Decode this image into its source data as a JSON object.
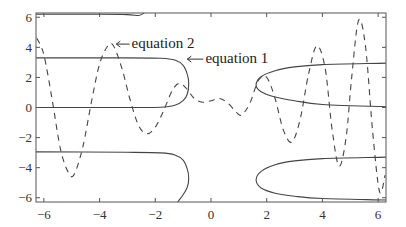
{
  "chart_data": {
    "type": "line",
    "title": "",
    "xlabel": "",
    "ylabel": "",
    "xlim": [
      -6.2832,
      6.2832
    ],
    "ylim": [
      -6.2832,
      6.2832
    ],
    "grid": false,
    "legend": null,
    "xticks": [
      -6,
      -4,
      -2,
      0,
      2,
      4,
      6
    ],
    "yticks": [
      -6,
      -4,
      -2,
      0,
      2,
      4,
      6
    ],
    "xtick_labels": [
      "−6",
      "−4",
      "−2",
      "0",
      "2",
      "4",
      "6"
    ],
    "ytick_labels": [
      "−6",
      "−4",
      "−2",
      "0",
      "2",
      "4",
      "6"
    ],
    "annotations": [
      {
        "text": "equation 2",
        "arrow_to": [
          -3.4,
          4.2
        ],
        "text_at": [
          -2.85,
          3.95
        ]
      },
      {
        "text": "equation 1",
        "arrow_to": [
          -0.85,
          3.2
        ],
        "text_at": [
          -0.2,
          2.95
        ]
      }
    ],
    "series": [
      {
        "name": "equation 1",
        "style": "solid",
        "segments": [
          [
            [
              -6.28,
              6.2
            ],
            [
              -4,
              6.2
            ],
            [
              -3,
              6.18
            ],
            [
              -2.6,
              6.12
            ],
            [
              -2.4,
              6.28
            ]
          ],
          [
            [
              -6.28,
              3.3
            ],
            [
              -3,
              3.3
            ],
            [
              -1.8,
              3.27
            ],
            [
              -1.3,
              3.15
            ],
            [
              -1.0,
              2.8
            ],
            [
              -0.85,
              2.2
            ],
            [
              -0.8,
              1.6
            ],
            [
              -0.85,
              0.9
            ],
            [
              -1.0,
              0.45
            ],
            [
              -1.3,
              0.15
            ],
            [
              -1.8,
              0.02
            ],
            [
              -3,
              0.0
            ],
            [
              -6.28,
              0.0
            ]
          ],
          [
            [
              -6.28,
              -2.95
            ],
            [
              -3,
              -2.98
            ],
            [
              -1.8,
              -3.02
            ],
            [
              -1.3,
              -3.15
            ],
            [
              -1.0,
              -3.5
            ],
            [
              -0.85,
              -4.1
            ],
            [
              -0.8,
              -4.7
            ],
            [
              -0.85,
              -5.3
            ],
            [
              -1.0,
              -5.8
            ],
            [
              -1.2,
              -6.28
            ]
          ],
          [
            [
              6.28,
              2.95
            ],
            [
              4,
              2.85
            ],
            [
              3,
              2.7
            ],
            [
              2.3,
              2.45
            ],
            [
              1.8,
              2.05
            ],
            [
              1.62,
              1.5
            ],
            [
              1.8,
              1.05
            ],
            [
              2.3,
              0.7
            ],
            [
              3,
              0.45
            ],
            [
              4,
              0.2
            ],
            [
              6.28,
              0.05
            ]
          ],
          [
            [
              6.28,
              -3.3
            ],
            [
              4,
              -3.4
            ],
            [
              3,
              -3.55
            ],
            [
              2.3,
              -3.8
            ],
            [
              1.8,
              -4.25
            ],
            [
              1.62,
              -4.8
            ],
            [
              1.8,
              -5.35
            ],
            [
              2.3,
              -5.7
            ],
            [
              3,
              -5.9
            ],
            [
              4,
              -6.05
            ],
            [
              6.28,
              -6.15
            ]
          ]
        ]
      },
      {
        "name": "equation 2",
        "style": "dashed",
        "points": [
          [
            -6.25,
            4.6
          ],
          [
            -6.0,
            3.5
          ],
          [
            -5.7,
            0.5
          ],
          [
            -5.4,
            -2.8
          ],
          [
            -5.1,
            -4.4
          ],
          [
            -4.9,
            -4.4
          ],
          [
            -4.6,
            -2.6
          ],
          [
            -4.3,
            0.3
          ],
          [
            -4.0,
            2.9
          ],
          [
            -3.7,
            4.1
          ],
          [
            -3.5,
            4.1
          ],
          [
            -3.2,
            2.6
          ],
          [
            -2.9,
            0.5
          ],
          [
            -2.6,
            -1.2
          ],
          [
            -2.3,
            -1.75
          ],
          [
            -2.0,
            -1.3
          ],
          [
            -1.7,
            -0.2
          ],
          [
            -1.4,
            1.1
          ],
          [
            -1.15,
            1.6
          ],
          [
            -0.9,
            1.3
          ],
          [
            -0.6,
            0.6
          ],
          [
            -0.3,
            0.35
          ],
          [
            0.0,
            0.45
          ],
          [
            0.3,
            0.6
          ],
          [
            0.6,
            0.3
          ],
          [
            0.9,
            -0.3
          ],
          [
            1.1,
            -0.5
          ],
          [
            1.4,
            0.3
          ],
          [
            1.7,
            1.8
          ],
          [
            2.0,
            2.0
          ],
          [
            2.3,
            0.6
          ],
          [
            2.6,
            -1.5
          ],
          [
            2.9,
            -2.3
          ],
          [
            3.2,
            -0.8
          ],
          [
            3.5,
            2.2
          ],
          [
            3.8,
            4.1
          ],
          [
            4.1,
            2.6
          ],
          [
            4.35,
            -1.5
          ],
          [
            4.6,
            -3.9
          ],
          [
            4.85,
            -2.0
          ],
          [
            5.05,
            2.0
          ],
          [
            5.3,
            5.8
          ],
          [
            5.55,
            4.0
          ],
          [
            5.8,
            -1.5
          ],
          [
            6.05,
            -5.6
          ],
          [
            6.25,
            -4.5
          ]
        ]
      }
    ]
  },
  "plot_area": {
    "left": 36,
    "top": 13,
    "right": 386,
    "bottom": 202
  }
}
